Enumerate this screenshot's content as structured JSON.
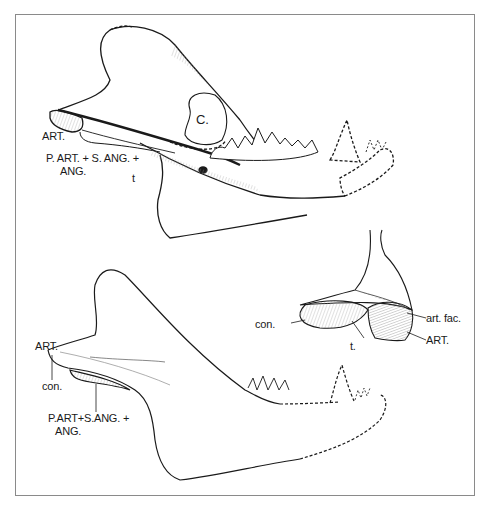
{
  "figure": {
    "type": "anatomical line drawing",
    "panels": [
      {
        "id": "upper-jaw-view",
        "labels": {
          "art": "ART.",
          "part_sang_ang_line1": "P. ART. + S. ANG. +",
          "part_sang_ang_line2": "ANG.",
          "coronoid": "C.",
          "t": "t"
        }
      },
      {
        "id": "articular-detail",
        "labels": {
          "con": "con.",
          "t": "t.",
          "art_fac": "art. fac.",
          "art": "ART."
        }
      },
      {
        "id": "lower-jaw-view",
        "labels": {
          "art": "ART.",
          "con": "con.",
          "part_sang_ang_line1": "P.ART+S.ANG. +",
          "part_sang_ang_line2": "ANG."
        }
      }
    ]
  },
  "colors": {
    "ink": "#1a1a1a",
    "frame": "#8a8a8a",
    "hatch": "#9a9a9a",
    "background": "#ffffff"
  }
}
